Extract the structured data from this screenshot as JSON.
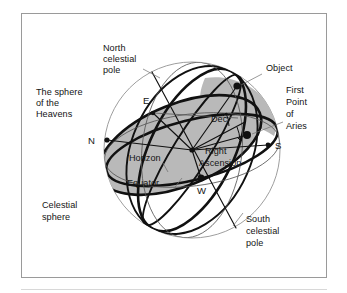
{
  "figure": {
    "frame_color": "#9a9a9a",
    "background_color": "#ffffff",
    "shading_color": "#b9b9b9",
    "line_color": "#111111",
    "outline_color": "#8d8d8d"
  },
  "labels": {
    "north_celestial_pole_line1": "North",
    "north_celestial_pole_line2": "celestial",
    "north_celestial_pole_line3": "pole",
    "sphere_of_heavens_line1": "The sphere",
    "sphere_of_heavens_line2": "of the",
    "sphere_of_heavens_line3": "Heavens",
    "celestial_sphere_line1": "Celestial",
    "celestial_sphere_line2": "sphere",
    "south_celestial_pole_line1": "South",
    "south_celestial_pole_line2": "celestial",
    "south_celestial_pole_line3": "pole",
    "object": "Object",
    "first_point_of_aries_line1": "First",
    "first_point_of_aries_line2": "Point",
    "first_point_of_aries_line3": "of",
    "first_point_of_aries_line4": "Aries",
    "dec": "Dec",
    "right_ascension_line1": "Right",
    "right_ascension_line2": "Ascension",
    "horizon": "Horizon",
    "equator": "Equator"
  },
  "cardinal_points": {
    "north": "N",
    "east": "E",
    "south": "S",
    "west": "W"
  },
  "geometry": {
    "sphere_center_x": 192,
    "sphere_center_y": 150,
    "sphere_radius": 88,
    "point_north_x": 107,
    "point_north_y": 140,
    "point_east_x": 153,
    "point_east_y": 113,
    "point_south_x": 268,
    "point_south_y": 145,
    "point_west_x": 201,
    "point_west_y": 178,
    "point_object_x": 237,
    "point_object_y": 86,
    "point_aries_x": 247,
    "point_aries_y": 135
  }
}
